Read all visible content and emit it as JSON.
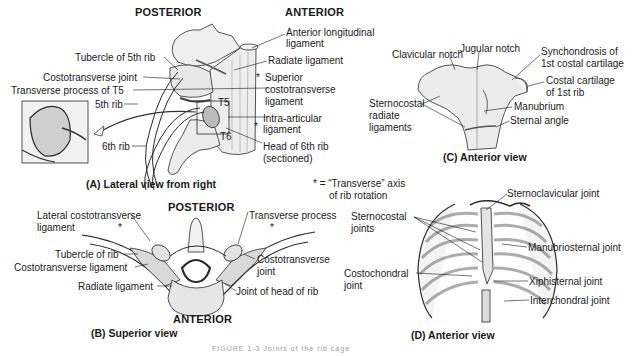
{
  "panel_a": {
    "header_posterior": "POSTERIOR",
    "header_anterior": "ANTERIOR",
    "caption": "(A) Lateral view from right",
    "labels": {
      "anterior_longitudinal": "Anterior longitudinal",
      "anterior_longitudinal_2": "ligament",
      "radiate": "Radiate ligament",
      "superior_costo_1": "Superior",
      "superior_costo_2": "costotransverse",
      "superior_costo_3": "ligament",
      "intra_articular_1": "Intra-articular",
      "intra_articular_2": "ligament",
      "head_6th_1": "Head of 6th rib",
      "head_6th_2": "(sectioned)",
      "tubercle_5th": "Tubercle of 5th rib",
      "costotransverse_joint": "Costotransverse joint",
      "transverse_process_t5": "Transverse process of T5",
      "rib_5th": "5th rib",
      "rib_6th": "6th rib",
      "t5": "T5",
      "t6": "T6",
      "star1": "*",
      "star2": "*"
    }
  },
  "panel_b": {
    "header_posterior": "POSTERIOR",
    "header_anterior": "ANTERIOR",
    "caption": "(B) Superior view",
    "labels": {
      "lateral_costo_1": "Lateral costotransverse",
      "lateral_costo_2": "ligament",
      "tubercle": "Tubercle of rib",
      "costo_ligament": "Costotransverse ligament",
      "radiate": "Radiate ligament",
      "transverse_process": "Transverse process",
      "costo_joint_1": "Costotransverse",
      "costo_joint_2": "joint",
      "joint_head": "Joint of head of rib",
      "star_left": "*",
      "star_right": "*"
    }
  },
  "panel_c": {
    "caption": "(C) Anterior view",
    "labels": {
      "clavicular_notch": "Clavicular notch",
      "jugular_notch": "Jugular notch",
      "synchondrosis_1": "Synchondrosis of",
      "synchondrosis_2": "1st costal cartilage",
      "costal_cartilage_1": "Costal cartilage",
      "costal_cartilage_2": "of 1st rib",
      "sternocostal_1": "Sternocostal",
      "sternocostal_2": "radiate",
      "sternocostal_3": "ligaments",
      "manubrium": "Manubrium",
      "sternal_angle": "Sternal angle"
    }
  },
  "panel_d": {
    "caption": "(D) Anterior view",
    "legend_1": "* = “Transverse” axis",
    "legend_2": "of rib rotation",
    "labels": {
      "sternoclavicular": "Sternoclavicular joint",
      "sternocostal_1": "Sternocostal",
      "sternocostal_2": "joints",
      "manubriosternal": "Manubriosternal joint",
      "costochondral_1": "Costochondral",
      "costochondral_2": "joint",
      "xiphisternal": "Xiphisternal joint",
      "interchondral": "Interchondral joint"
    }
  },
  "figure_caption": "FIGURE 1-3  Joints of the rib cage"
}
